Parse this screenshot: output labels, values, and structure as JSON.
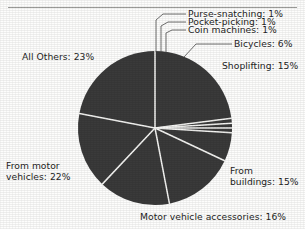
{
  "figure": {
    "title_partial": "",
    "background_color": "#fdfdfc",
    "slice_color": "#3a3a3a",
    "separator_color": "#f4f4f2",
    "leader_color": "#4a4a4a"
  },
  "chart_data": {
    "type": "pie",
    "title": "",
    "xlabel": "",
    "ylabel": "",
    "legend": "none (direct labels with leader lines)",
    "grid": false,
    "units": "percent",
    "total": 100,
    "center": {
      "x": 155,
      "y": 128
    },
    "radius": 77,
    "start_angle_deg": -90,
    "direction": "clockwise",
    "categories": [
      "All Others",
      "Purse-snatching",
      "Pocket-picking",
      "Coin machines",
      "Bicycles",
      "Shoplifting",
      "From buildings",
      "Motor vehicle accessories",
      "From motor vehicles"
    ],
    "values": [
      23,
      1,
      1,
      1,
      6,
      15,
      15,
      16,
      22
    ],
    "slices": [
      {
        "label": "All Others",
        "value": 23,
        "label_text": "All Others: 23%"
      },
      {
        "label": "Purse-snatching",
        "value": 1,
        "label_text": "Purse-snatching: 1%"
      },
      {
        "label": "Pocket-picking",
        "value": 1,
        "label_text": "Pocket-picking: 1%"
      },
      {
        "label": "Coin machines",
        "value": 1,
        "label_text": "Coin machines: 1%"
      },
      {
        "label": "Bicycles",
        "value": 6,
        "label_text": "Bicycles: 6%"
      },
      {
        "label": "Shoplifting",
        "value": 15,
        "label_text": "Shoplifting: 15%"
      },
      {
        "label": "From buildings",
        "value": 15,
        "label_text": "From buildings: 15%"
      },
      {
        "label": "Motor vehicle accessories",
        "value": 16,
        "label_text": "Motor vehicle accessories: 16%"
      },
      {
        "label": "From motor vehicles",
        "value": 22,
        "label_text": "From motor vehicles: 22%"
      }
    ]
  },
  "labels": {
    "purse_snatching": "Purse-snatching: 1%",
    "pocket_picking": "Pocket-picking: 1%",
    "coin_machines": "Coin machines: 1%",
    "bicycles": "Bicycles: 6%",
    "shoplifting": "Shoplifting: 15%",
    "all_others": "All Others: 23%",
    "from_motor_vehicles_line1": "From motor",
    "from_motor_vehicles_line2": "vehicles: 22%",
    "from_buildings_line1": "From",
    "from_buildings_line2": "buildings: 15%",
    "motor_vehicle_accessories": "Motor vehicle accessories: 16%"
  }
}
